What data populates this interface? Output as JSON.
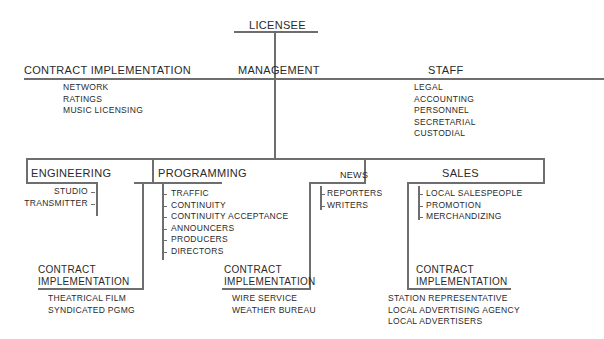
{
  "chart": {
    "root": "LICENSEE",
    "management": "MANAGEMENT",
    "management_contract": {
      "title": "CONTRACT IMPLEMENTATION",
      "items": [
        "NETWORK",
        "RATINGS",
        "MUSIC LICENSING"
      ]
    },
    "staff": {
      "title": "STAFF",
      "items": [
        "LEGAL",
        "ACCOUNTING",
        "PERSONNEL",
        "SECRETARIAL",
        "CUSTODIAL"
      ]
    },
    "engineering": {
      "title": "ENGINEERING",
      "items": [
        "STUDIO",
        "TRANSMITTER"
      ]
    },
    "programming": {
      "title": "PROGRAMMING",
      "items": [
        "TRAFFIC",
        "CONTINUITY",
        "CONTINUITY ACCEPTANCE",
        "ANNOUNCERS",
        "PRODUCERS",
        "DIRECTORS"
      ],
      "contract": {
        "line1": "CONTRACT",
        "line2": "IMPLEMENTATION",
        "items": [
          "THEATRICAL FILM",
          "SYNDICATED PGMG"
        ]
      }
    },
    "news": {
      "title": "NEWS",
      "items": [
        "REPORTERS",
        "WRITERS"
      ],
      "contract": {
        "line1": "CONTRACT",
        "line2": "IMPLEMENTATION",
        "items": [
          "WIRE SERVICE",
          "WEATHER BUREAU"
        ]
      }
    },
    "sales": {
      "title": "SALES",
      "items": [
        "LOCAL SALESPEOPLE",
        "PROMOTION",
        "MERCHANDIZING"
      ],
      "contract": {
        "line1": "CONTRACT",
        "line2": "IMPLEMENTATION",
        "items": [
          "STATION REPRESENTATIVE",
          "LOCAL ADVERTISING AGENCY",
          "LOCAL ADVERTISERS"
        ]
      }
    }
  }
}
